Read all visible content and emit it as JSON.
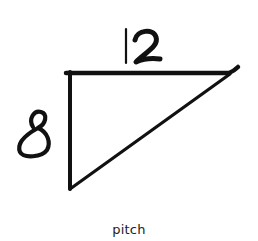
{
  "diagram": {
    "title": "pitch",
    "shape": "right-triangle",
    "labels": {
      "run": "12",
      "rise": "8"
    },
    "caption": "pitch",
    "colors": {
      "stroke": "#111111",
      "background": "#ffffff",
      "caption": "#222222"
    }
  }
}
